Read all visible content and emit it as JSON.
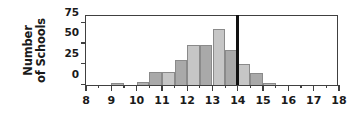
{
  "chart_data": {
    "type": "bar",
    "title": "",
    "xlabel": "",
    "ylabel": "Number of Schools",
    "ylabel_line1": "Number",
    "ylabel_line2": "of Schools",
    "xlim": [
      8,
      18
    ],
    "ylim": [
      0,
      86
    ],
    "grid": false,
    "legend": null,
    "bin_width": 0.5,
    "ytick_values": [
      0,
      25,
      50,
      75
    ],
    "ytick_labels": [
      "0",
      "25",
      "50",
      "75"
    ],
    "xtick_values": [
      8,
      9,
      10,
      11,
      12,
      13,
      14,
      15,
      16,
      17,
      18
    ],
    "xtick_labels": [
      "8",
      "9",
      "10",
      "11",
      "12",
      "13",
      "14",
      "15",
      "16",
      "17",
      "18"
    ],
    "xminor_values": [
      8.5,
      9.5,
      10.5,
      11.5,
      12.5,
      13.5,
      14.5,
      15.5,
      16.5,
      17.5
    ],
    "bin_starts": [
      9.0,
      9.5,
      10.0,
      10.5,
      11.0,
      11.5,
      12.0,
      12.5,
      13.0,
      13.5,
      14.0,
      14.5,
      15.0
    ],
    "values": [
      3,
      0,
      4,
      16,
      16,
      30,
      49,
      48,
      68,
      42,
      25,
      14,
      3
    ],
    "bar_colors": [
      "#b0b0b0",
      "#cccccc",
      "#b0b0b0",
      "#a9a9a9",
      "#c6c6c6",
      "#a9a9a9",
      "#c6c6c6",
      "#a9a9a9",
      "#c6c6c6",
      "#a9a9a9",
      "#c6c6c6",
      "#a9a9a9",
      "#b8b8b8"
    ],
    "annotations": [
      {
        "name": "reference-line",
        "type": "vline",
        "x": 14,
        "color": "#111111",
        "width_px": 3
      }
    ]
  }
}
